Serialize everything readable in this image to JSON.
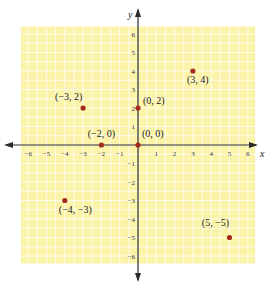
{
  "chart_data": {
    "type": "scatter",
    "title": "",
    "xlabel": "x",
    "ylabel": "y",
    "xlim": [
      -6,
      6
    ],
    "ylim": [
      -6,
      6
    ],
    "grid": true,
    "x_ticks": [
      -6,
      -5,
      -4,
      -3,
      -2,
      -1,
      1,
      2,
      3,
      4,
      5,
      6
    ],
    "y_ticks": [
      -6,
      -5,
      -4,
      -3,
      -2,
      -1,
      1,
      2,
      3,
      4,
      5,
      6
    ],
    "x_tick_labels": [
      "−6",
      "−5",
      "−4",
      "−3",
      "−2",
      "−1",
      "1",
      "2",
      "3",
      "4",
      "5",
      "6"
    ],
    "y_tick_labels": [
      "−6",
      "−5",
      "−4",
      "−3",
      "−2",
      "−1",
      "1",
      "2",
      "3",
      "4",
      "5",
      "6"
    ],
    "points": [
      {
        "x": -3,
        "y": 2,
        "label": "(−3, 2)",
        "label_pos": "above-left"
      },
      {
        "x": 0,
        "y": 2,
        "label": "(0, 2)",
        "label_pos": "right"
      },
      {
        "x": 3,
        "y": 4,
        "label": "(3, 4)",
        "label_pos": "below-right"
      },
      {
        "x": -2,
        "y": 0,
        "label": "(−2, 0)",
        "label_pos": "above"
      },
      {
        "x": 0,
        "y": 0,
        "label": "(0, 0)",
        "label_pos": "above-right"
      },
      {
        "x": -4,
        "y": -3,
        "label": "(−4, −3)",
        "label_pos": "below-right"
      },
      {
        "x": 5,
        "y": -5,
        "label": "(5, −5)",
        "label_pos": "above-left"
      }
    ],
    "colors": {
      "grid_fill": "#fbf3a8",
      "grid_lines": "#ffffff",
      "axis": "#2a2a2a",
      "point": "#a52a1e"
    }
  }
}
